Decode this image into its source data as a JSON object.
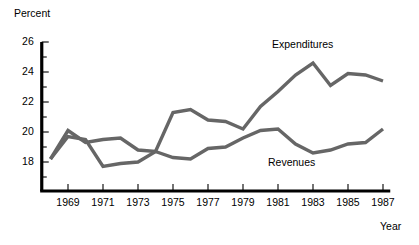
{
  "chart_data": {
    "type": "line",
    "title": "",
    "xlabel": "Year",
    "ylabel": "Percent",
    "x": [
      1968,
      1969,
      1970,
      1971,
      1972,
      1973,
      1974,
      1975,
      1976,
      1977,
      1978,
      1979,
      1980,
      1981,
      1982,
      1983,
      1984,
      1985,
      1986,
      1987
    ],
    "xlim": [
      1967.5,
      1987.3
    ],
    "ylim": [
      16.6,
      26.0
    ],
    "grid": false,
    "legend_position": "inline-annotations",
    "y_ticks_major": [
      18,
      20,
      22,
      24,
      26
    ],
    "y_ticks_minor": [
      17,
      19,
      21,
      23,
      25
    ],
    "x_ticks_major": [
      1969,
      1971,
      1973,
      1975,
      1977,
      1979,
      1981,
      1983,
      1985,
      1987
    ],
    "y_tick_labels": [
      "18",
      "20",
      "22",
      "24",
      "26"
    ],
    "x_tick_labels": [
      "1969",
      "1971",
      "1973",
      "1975",
      "1977",
      "1979",
      "1981",
      "1983",
      "1985",
      "1987"
    ],
    "line_color": "#666666",
    "axis_color": "#000000",
    "series": [
      {
        "name": "Expenditures",
        "label_x": 1979.6,
        "label_y": 25.3,
        "values": [
          18.2,
          20.1,
          19.3,
          19.5,
          19.6,
          18.8,
          18.7,
          21.3,
          21.5,
          20.8,
          20.7,
          20.2,
          21.7,
          22.7,
          23.8,
          24.6,
          23.1,
          23.9,
          23.8,
          23.4
        ]
      },
      {
        "name": "Revenues",
        "label_x": 1979.4,
        "label_y": 17.6,
        "values": [
          18.2,
          19.7,
          19.5,
          17.7,
          17.9,
          18.0,
          18.7,
          18.3,
          18.2,
          18.9,
          19.0,
          19.6,
          20.1,
          20.2,
          19.2,
          18.6,
          18.8,
          19.2,
          19.3,
          20.2
        ]
      }
    ]
  }
}
